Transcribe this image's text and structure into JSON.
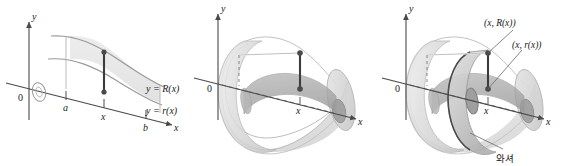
{
  "figure": {
    "kind": "calculus-washer-method-figure",
    "background": "#ffffff",
    "ink": "#3a3a3a",
    "panels": [
      {
        "id": "panel-region-2d",
        "caption_labels": {
          "y_axis": "y",
          "x_axis": "x",
          "origin": "0",
          "tick_a": "a",
          "tick_x": "x",
          "tick_b": "b",
          "curve_outer": "y = R(x)",
          "curve_inner": "y = r(x)"
        }
      },
      {
        "id": "panel-solid-3d",
        "caption_labels": {
          "y_axis": "y",
          "x_axis": "x",
          "origin": "0",
          "tick_x": "x"
        }
      },
      {
        "id": "panel-washer-3d",
        "caption_labels": {
          "y_axis": "y",
          "x_axis": "x",
          "origin": "0",
          "tick_x": "x",
          "point_outer": "(x, R(x))",
          "point_inner": "(x, r(x))",
          "washer": "와셔"
        }
      }
    ],
    "colors": {
      "axis": "#4a4a4a",
      "curve": "#8a8a8a",
      "segment": "#3c3c3c",
      "dot": "#4a4a4a",
      "surface_light": "#e3e3e3",
      "surface_mid": "#cfcfcf",
      "surface_dark": "#b4b4b4",
      "surface_core": "#a9a9a9",
      "leader": "#6a6a6a"
    }
  }
}
